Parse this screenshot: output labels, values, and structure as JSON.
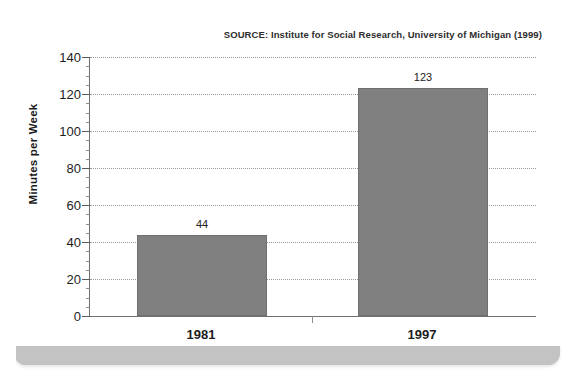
{
  "chart_data": {
    "type": "bar",
    "title": "",
    "subtitle": "",
    "source_note": "SOURCE: Institute for Social Research, University of Michigan (1999)",
    "categories": [
      "1981",
      "1997"
    ],
    "values": [
      44,
      123
    ],
    "value_labels": [
      "44",
      "123"
    ],
    "xlabel": "",
    "ylabel": "Minutes per Week",
    "ylim": [
      0,
      140
    ],
    "ytick_values": [
      0,
      20,
      40,
      60,
      80,
      100,
      120,
      140
    ],
    "ytick_labels": [
      "0",
      "20",
      "40",
      "60",
      "80",
      "100",
      "120",
      "140"
    ],
    "ytick_step": 20,
    "yminor_step": 5,
    "grid": "horizontal-dotted",
    "legend": "none",
    "bar_color": "#808080",
    "bar_edge_color": "#6f6f6f",
    "gridline_color": "#9a9a9a",
    "axis_color": "#707070",
    "plot_background": "#ffffff",
    "panel_background": "#d2d2d2",
    "text_color": "#1d1d1d"
  }
}
